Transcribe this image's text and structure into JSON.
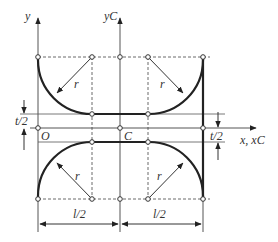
{
  "diagram": {
    "type": "cross-section geometry",
    "colors": {
      "line": "#333333",
      "thin": "#555555",
      "dash": "#444444",
      "background": "#ffffff"
    },
    "labels": {
      "y_axis": "y",
      "yc_axis": "yC",
      "x_axis": "x, xC",
      "origin": "O",
      "centroid": "C",
      "radius_top_left": "r",
      "radius_top_right": "r",
      "radius_bottom_left": "r",
      "radius_bottom_right": "r",
      "thickness_left": "t/2",
      "thickness_right": "t/2",
      "half_length_left": "l/2",
      "half_length_right": "l/2"
    }
  }
}
